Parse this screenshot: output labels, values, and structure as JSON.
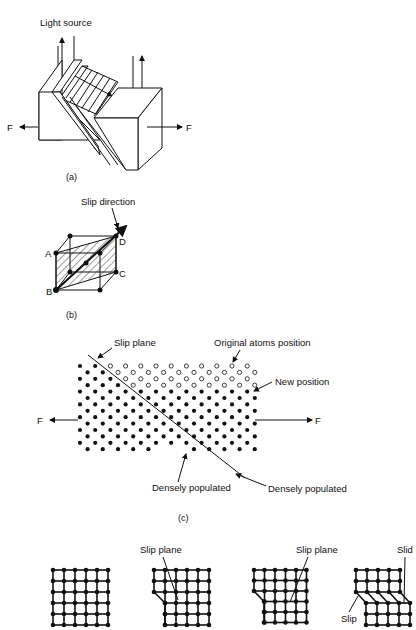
{
  "figure_a": {
    "light_source_label": "Light source",
    "force_left": "F",
    "force_right": "F",
    "caption": "(a)"
  },
  "figure_b": {
    "slip_direction_label": "Slip direction",
    "vertex_a": "A",
    "vertex_b": "B",
    "vertex_c": "C",
    "vertex_d": "D",
    "caption": "(b)"
  },
  "figure_c": {
    "slip_plane_label": "Slip plane",
    "original_atoms_label": "Original atoms position",
    "new_position_label": "New position",
    "densely_populated_left": "Densely populated",
    "densely_populated_right": "Densely populated",
    "force_left": "F",
    "force_right": "F",
    "caption": "(c)"
  },
  "figure_d": {
    "slip_plane_label_1": "Slip plane",
    "slip_plane_label_2": "Slip plane",
    "slid_label": "Slid",
    "slip_label": "Slip"
  }
}
